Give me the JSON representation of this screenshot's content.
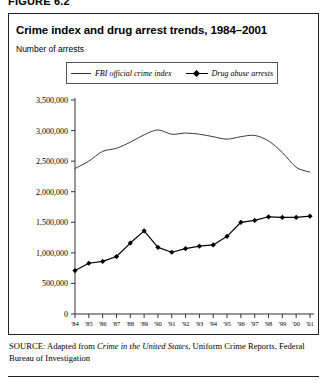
{
  "figure": {
    "number_label": "FIGURE 6.2"
  },
  "chart_title": "Crime index and drug arrest trends, 1984–2001",
  "chart_subtitle": "Number of arrests",
  "legend": {
    "position": "top-center",
    "entries": [
      {
        "label": "FBI official crime index",
        "marker": "line",
        "swatch_name": "legend-swatch-crime-index"
      },
      {
        "label": "Drug abuse arrests",
        "marker": "line-with-diamond",
        "swatch_name": "legend-swatch-drug-arrests"
      }
    ]
  },
  "source": {
    "label": "SOURCE:",
    "text_before_italic": " Adapted from ",
    "italic_text": "Crime in the United States",
    "text_after_italic": ", Uniform Crime Reports, Federal Bureau of Investigation"
  },
  "chart_data": {
    "type": "line",
    "title": "Crime index and drug arrest trends, 1984–2001",
    "subtitle": "Number of arrests",
    "xlabel": "",
    "ylabel": "Number of arrests",
    "grid": false,
    "legend_position": "top-center",
    "ylim": [
      0,
      3500000
    ],
    "ytick_values": [
      0,
      500000,
      1000000,
      1500000,
      2000000,
      2500000,
      3000000,
      3500000
    ],
    "ytick_labels": [
      "0",
      "500,000",
      "1,000,000",
      "1,500,000",
      "2,000,000",
      "2,500,000",
      "3,000,000",
      "3,500,000"
    ],
    "x": [
      1984,
      1985,
      1986,
      1987,
      1988,
      1989,
      1990,
      1991,
      1992,
      1993,
      1994,
      1995,
      1996,
      1997,
      1998,
      1999,
      2000,
      2001
    ],
    "xtick_labels": [
      "'84",
      "'85",
      "'86",
      "'87",
      "'88",
      "'89",
      "'90",
      "'91",
      "'92",
      "'93",
      "'94",
      "'95",
      "'96",
      "'97",
      "'98",
      "'99",
      "'00",
      "'01"
    ],
    "series": [
      {
        "name": "FBI official crime index",
        "style": "line",
        "values": [
          2380000,
          2500000,
          2660000,
          2710000,
          2810000,
          2930000,
          3010000,
          2940000,
          2960000,
          2940000,
          2900000,
          2860000,
          2900000,
          2920000,
          2830000,
          2640000,
          2400000,
          2320000
        ]
      },
      {
        "name": "Drug abuse arrests",
        "style": "line-with-diamond",
        "values": [
          710000,
          830000,
          860000,
          940000,
          1160000,
          1360000,
          1090000,
          1010000,
          1070000,
          1110000,
          1130000,
          1270000,
          1500000,
          1530000,
          1590000,
          1580000,
          1580000,
          1600000
        ]
      }
    ]
  }
}
